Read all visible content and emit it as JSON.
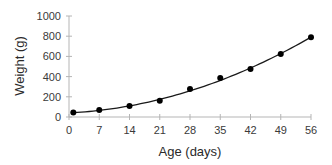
{
  "chart_data": {
    "type": "scatter",
    "title": "",
    "xlabel": "Age (days)",
    "ylabel": "Weight (g)",
    "xlim": [
      0,
      56
    ],
    "ylim": [
      0,
      1000
    ],
    "xticks": [
      0,
      7,
      14,
      21,
      28,
      35,
      42,
      49,
      56
    ],
    "yticks": [
      0,
      200,
      400,
      600,
      800,
      1000
    ],
    "grid": false,
    "legend": "none",
    "series": [
      {
        "name": "Observed weight",
        "marker": "circle",
        "color": "#000000",
        "x": [
          1,
          7,
          14,
          21,
          28,
          35,
          42,
          49,
          56
        ],
        "y": [
          45,
          70,
          110,
          160,
          277,
          386,
          475,
          624,
          790
        ]
      }
    ],
    "trendline": {
      "name": "Fitted curve",
      "type": "quadratic",
      "color": "#1a1a1a",
      "x_range": [
        1,
        56
      ],
      "coefficients": {
        "a": 0.2,
        "b": 2.2,
        "c": 40
      }
    }
  }
}
